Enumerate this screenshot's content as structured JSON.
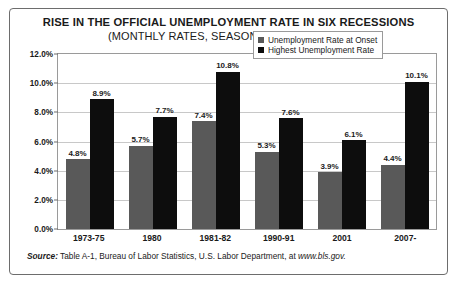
{
  "chart_data": {
    "type": "bar",
    "title": "RISE IN THE OFFICIAL UNEMPLOYMENT RATE IN SIX RECESSIONS",
    "subtitle": "(MONTHLY RATES, SEASONALLY ADJUSTED)",
    "categories": [
      "1973-75",
      "1980",
      "1981-82",
      "1990-91",
      "2001",
      "2007-"
    ],
    "series": [
      {
        "name": "Unemployment Rate at Onset",
        "color": "#595959",
        "values": [
          4.8,
          5.7,
          7.4,
          5.3,
          3.9,
          4.4
        ],
        "labels": [
          "4.8%",
          "5.7%",
          "7.4%",
          "5.3%",
          "3.9%",
          "4.4%"
        ]
      },
      {
        "name": "Highest Unemployment Rate",
        "color": "#0d0d0d",
        "values": [
          8.9,
          7.7,
          10.8,
          7.6,
          6.1,
          10.1
        ],
        "labels": [
          "8.9%",
          "7.7%",
          "10.8%",
          "7.6%",
          "6.1%",
          "10.1%"
        ]
      }
    ],
    "xlabel": "",
    "ylabel": "",
    "ylim": [
      0,
      12
    ],
    "ytick_values": [
      0,
      2,
      4,
      6,
      8,
      10,
      12
    ],
    "ytick_labels": [
      "0.0%",
      "2.0%",
      "4.0%",
      "6.0%",
      "8.0%",
      "10.0%",
      "12.0%"
    ],
    "grid": true,
    "legend_position": "top-right"
  },
  "source": {
    "label": "Source:",
    "text": " Table A-1,  Bureau of Labor Statistics, U.S. Labor Department, at ",
    "url": "www.bls.gov."
  }
}
